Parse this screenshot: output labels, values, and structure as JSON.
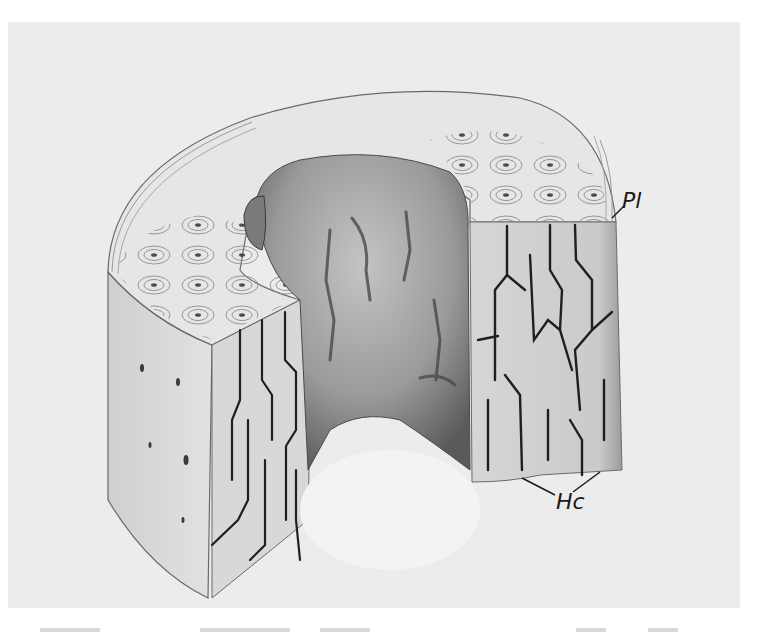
{
  "figure": {
    "colors": {
      "plate_background": "#ececec",
      "bone_surface": "#dcdcdc",
      "bone_shadow": "#8a8a8a",
      "ink": "#1a1a1a",
      "marrow_cavity": "#f7f7f7"
    },
    "labels": {
      "pl": "Pl",
      "hc": "Hc"
    },
    "regions": [
      {
        "id": "top-face",
        "description": "Cut top surface showing concentric Haversian systems (osteons)"
      },
      {
        "id": "marrow-cavity",
        "description": "Central medullary cavity with irregular endosteal wall"
      },
      {
        "id": "outer-wall",
        "description": "Outer cylindrical surface of the bone"
      },
      {
        "id": "cut-face-left",
        "description": "Longitudinal cut face showing branching Haversian canals"
      },
      {
        "id": "cut-face-right",
        "description": "Longitudinal cut face showing branching Haversian canals"
      }
    ]
  }
}
